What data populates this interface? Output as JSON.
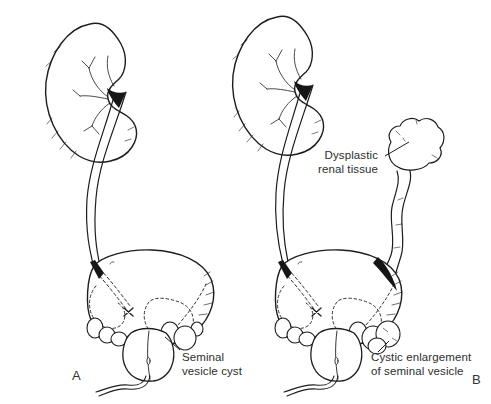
{
  "figure": {
    "background_color": "#ffffff",
    "ink_color": "#1d1d1d",
    "text_color": "#2e2e2e",
    "panel_a": {
      "letter": "A",
      "seminal_vesicle_cyst_label": {
        "line1": "Seminal",
        "line2": "vesicle cyst"
      }
    },
    "panel_b": {
      "letter": "B",
      "dysplastic_label": {
        "line1": "Dysplastic",
        "line2": "renal tissue"
      },
      "cystic_label": {
        "line1": "Cystic enlargement",
        "line2": "of seminal vesicle"
      }
    }
  }
}
